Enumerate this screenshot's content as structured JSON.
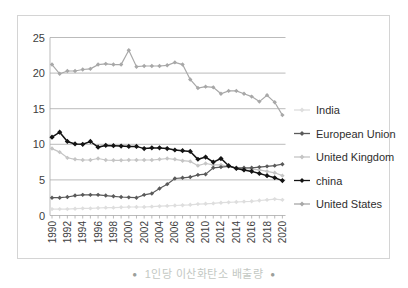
{
  "chart_data": {
    "type": "line",
    "title": "",
    "x": [
      1990,
      1991,
      1992,
      1993,
      1994,
      1995,
      1996,
      1997,
      1998,
      1999,
      2000,
      2001,
      2002,
      2003,
      2004,
      2005,
      2006,
      2007,
      2008,
      2009,
      2010,
      2011,
      2012,
      2013,
      2014,
      2015,
      2016,
      2017,
      2018,
      2019,
      2020
    ],
    "x_tick_labels": [
      "1990",
      "1992",
      "1994",
      "1996",
      "1998",
      "2000",
      "2002",
      "2004",
      "2006",
      "2008",
      "2010",
      "2012",
      "2014",
      "2016",
      "2018",
      "2020"
    ],
    "ylim": [
      0,
      25
    ],
    "y_ticks": [
      0,
      5,
      10,
      15,
      20,
      25
    ],
    "grid": "horizontal",
    "legend_position": "right",
    "draw_order": [
      0,
      2,
      4,
      1,
      3
    ],
    "series": [
      {
        "name": "India",
        "color": "#dedede",
        "values": [
          0.9,
          0.9,
          0.9,
          0.95,
          1.0,
          1.0,
          1.05,
          1.1,
          1.1,
          1.15,
          1.2,
          1.2,
          1.2,
          1.25,
          1.3,
          1.35,
          1.4,
          1.45,
          1.5,
          1.6,
          1.65,
          1.7,
          1.8,
          1.85,
          1.9,
          1.95,
          2.0,
          2.1,
          2.2,
          2.3,
          2.2
        ]
      },
      {
        "name": "European Union",
        "color": "#5a5a5a",
        "values": [
          2.5,
          2.5,
          2.6,
          2.8,
          2.9,
          2.9,
          2.9,
          2.8,
          2.7,
          2.6,
          2.55,
          2.5,
          2.9,
          3.1,
          3.8,
          4.4,
          5.2,
          5.3,
          5.4,
          5.7,
          5.8,
          6.7,
          6.8,
          6.9,
          6.7,
          6.7,
          6.7,
          6.8,
          6.9,
          7.0,
          7.2
        ]
      },
      {
        "name": "United Kingdom",
        "color": "#c5c5c5",
        "values": [
          9.4,
          8.9,
          8.1,
          7.9,
          7.8,
          7.8,
          8.0,
          7.8,
          7.75,
          7.75,
          7.8,
          7.8,
          7.8,
          7.8,
          7.9,
          8.0,
          7.9,
          7.7,
          7.6,
          7.0,
          7.3,
          7.1,
          7.1,
          6.9,
          6.6,
          6.6,
          6.5,
          6.4,
          6.2,
          6.0,
          5.6
        ]
      },
      {
        "name": "china",
        "color": "#141414",
        "values": [
          11.0,
          11.7,
          10.4,
          10.05,
          10.0,
          10.4,
          9.6,
          9.85,
          9.8,
          9.75,
          9.7,
          9.7,
          9.4,
          9.5,
          9.5,
          9.4,
          9.2,
          9.1,
          9.0,
          7.9,
          8.2,
          7.5,
          8.0,
          7.0,
          6.6,
          6.4,
          6.2,
          5.9,
          5.6,
          5.3,
          4.9
        ]
      },
      {
        "name": "United States",
        "color": "#a8a8a8",
        "values": [
          21.2,
          19.9,
          20.3,
          20.3,
          20.5,
          20.6,
          21.2,
          21.3,
          21.2,
          21.2,
          23.2,
          20.9,
          21.0,
          21.0,
          21.0,
          21.1,
          21.5,
          21.2,
          19.1,
          17.9,
          18.1,
          18.0,
          17.1,
          17.5,
          17.5,
          17.1,
          16.7,
          16.0,
          16.9,
          15.9,
          14.1
        ]
      }
    ]
  },
  "legend": {
    "items": [
      "India",
      "European Union",
      "United Kingdom",
      "china",
      "United States"
    ]
  },
  "caption": {
    "text": "1인당 이산화탄소 배출량",
    "bullet": "●"
  },
  "colors": {
    "border": "#d4d4d4",
    "gridline": "#aaaaaa",
    "axis_text": "#3d3d3d",
    "caption_text": "#c3c8c3"
  }
}
